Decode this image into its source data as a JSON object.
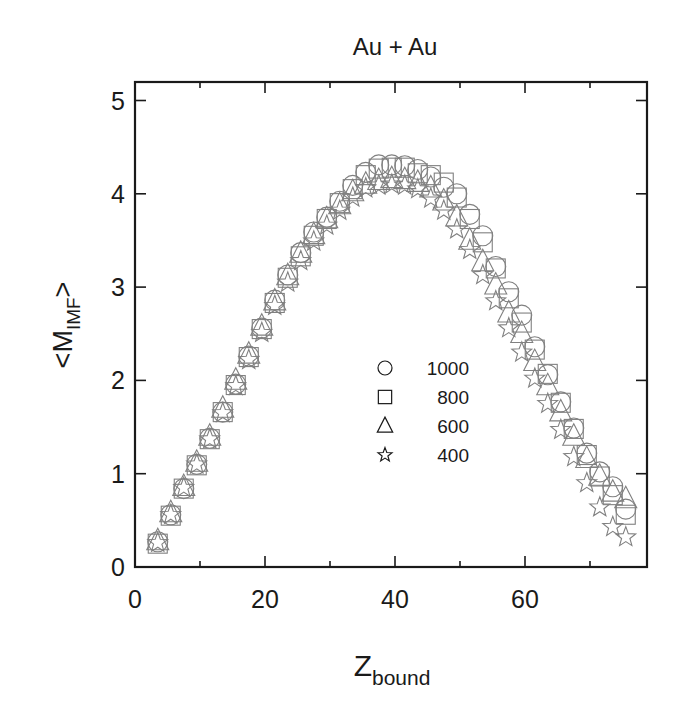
{
  "chart_data": {
    "type": "scatter",
    "title": "Au + Au",
    "xlabel": "Z_bound",
    "xlabel_main": "Z",
    "xlabel_sub": "bound",
    "ylabel": "<M_IMF>",
    "ylabel_main": "<M",
    "ylabel_sub": "IMF",
    "ylabel_end": ">",
    "xlim": [
      0,
      79
    ],
    "ylim": [
      0,
      5.15
    ],
    "xticks": [
      0,
      20,
      40,
      60
    ],
    "xticks_minor": [
      10,
      30,
      50,
      70
    ],
    "yticks": [
      0,
      1,
      2,
      3,
      4,
      5
    ],
    "grid": false,
    "legend_position": "inside-center-right",
    "x": [
      3.5,
      5.5,
      7.5,
      9.5,
      11.5,
      13.5,
      15.5,
      17.5,
      19.5,
      21.5,
      23.5,
      25.5,
      27.5,
      29.5,
      31.5,
      33.5,
      35.5,
      37.5,
      39.5,
      41.5,
      43.5,
      45.5,
      47.5,
      49.5,
      51.5,
      53.5,
      55.5,
      57.5,
      59.5,
      61.5,
      63.5,
      65.5,
      67.5,
      69.5,
      71.5,
      73.5,
      75.5
    ],
    "series": [
      {
        "name": "1000",
        "marker": "circle",
        "values": [
          0.27,
          0.56,
          0.84,
          1.1,
          1.38,
          1.66,
          1.96,
          2.26,
          2.56,
          2.86,
          3.13,
          3.37,
          3.59,
          3.75,
          3.92,
          4.09,
          4.23,
          4.31,
          4.31,
          4.3,
          4.26,
          4.18,
          4.07,
          4.0,
          3.78,
          3.55,
          3.22,
          2.95,
          2.7,
          2.36,
          2.06,
          1.77,
          1.49,
          1.22,
          1.02,
          0.86,
          0.62
        ]
      },
      {
        "name": "800",
        "marker": "square",
        "values": [
          0.25,
          0.55,
          0.84,
          1.09,
          1.37,
          1.66,
          1.95,
          2.25,
          2.55,
          2.83,
          3.1,
          3.33,
          3.55,
          3.73,
          3.9,
          4.05,
          4.2,
          4.27,
          4.28,
          4.28,
          4.22,
          4.2,
          4.12,
          3.96,
          3.73,
          3.48,
          3.2,
          2.88,
          2.62,
          2.33,
          2.07,
          1.76,
          1.48,
          1.2,
          0.97,
          0.77,
          0.56
        ]
      },
      {
        "name": "600",
        "marker": "triangle",
        "values": [
          0.28,
          0.58,
          0.86,
          1.12,
          1.4,
          1.7,
          2.0,
          2.28,
          2.58,
          2.85,
          3.12,
          3.36,
          3.56,
          3.73,
          3.88,
          4.02,
          4.1,
          4.14,
          4.16,
          4.15,
          4.12,
          4.06,
          3.92,
          3.75,
          3.5,
          3.27,
          3.02,
          2.72,
          2.5,
          2.2,
          1.94,
          1.66,
          1.4,
          1.16,
          0.97,
          0.8,
          0.73
        ]
      },
      {
        "name": "400",
        "marker": "star",
        "values": [
          0.26,
          0.56,
          0.85,
          1.1,
          1.37,
          1.65,
          1.94,
          2.22,
          2.51,
          2.8,
          3.05,
          3.28,
          3.49,
          3.66,
          3.82,
          3.96,
          4.06,
          4.09,
          4.1,
          4.09,
          4.05,
          3.95,
          3.82,
          3.62,
          3.4,
          3.13,
          2.85,
          2.56,
          2.3,
          2.02,
          1.75,
          1.47,
          1.18,
          0.9,
          0.64,
          0.43,
          0.32
        ]
      }
    ]
  }
}
